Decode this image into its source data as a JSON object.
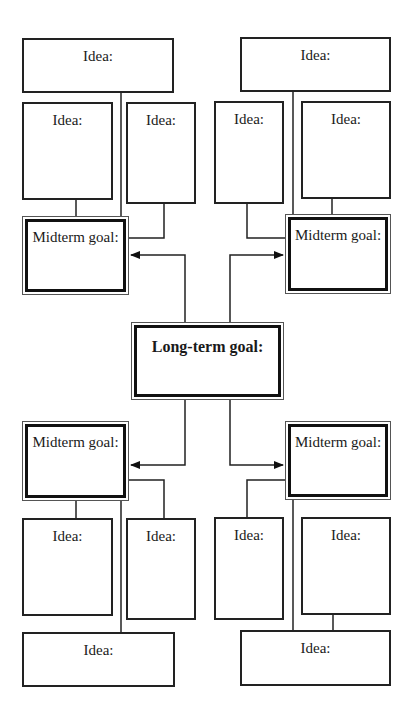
{
  "diagram": {
    "long_term": {
      "label": "Long-term goal:"
    },
    "quadrants": {
      "top_left": {
        "midterm": "Midterm goal:",
        "ideas": [
          "Idea:",
          "Idea:",
          "Idea:"
        ]
      },
      "top_right": {
        "midterm": "Midterm goal:",
        "ideas": [
          "Idea:",
          "Idea:",
          "Idea:"
        ]
      },
      "bottom_left": {
        "midterm": "Midterm goal:",
        "ideas": [
          "Idea:",
          "Idea:",
          "Idea:"
        ]
      },
      "bottom_right": {
        "midterm": "Midterm goal:",
        "ideas": [
          "Idea:",
          "Idea:",
          "Idea:"
        ]
      }
    }
  }
}
